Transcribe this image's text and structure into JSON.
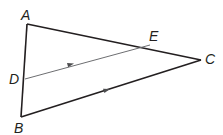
{
  "diagram": {
    "type": "triangle-with-parallel-segment",
    "labels": {
      "A": "A",
      "B": "B",
      "C": "C",
      "D": "D",
      "E": "E"
    },
    "segments": [
      {
        "name": "AB",
        "from": "A",
        "to": "B",
        "style": "thick"
      },
      {
        "name": "AC",
        "from": "A",
        "to": "C",
        "style": "thick"
      },
      {
        "name": "BC",
        "from": "B",
        "to": "C",
        "style": "thick",
        "parallel_mark": true
      },
      {
        "name": "DE",
        "from": "D",
        "to": "E",
        "style": "thin",
        "parallel_mark": true
      }
    ],
    "colors": {
      "triangle": "#231f20",
      "segment_de": "#6d6e71",
      "arrow": "#4d4d4f"
    }
  }
}
